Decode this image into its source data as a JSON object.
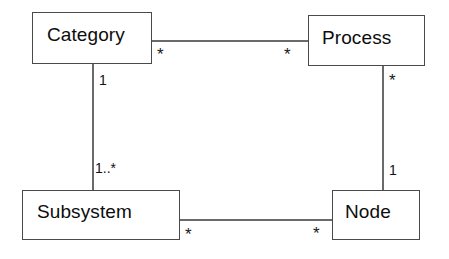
{
  "diagram": {
    "type": "uml-class-diagram",
    "title": "",
    "background_color": "#ffffff",
    "line_color": "#6a6a6a",
    "border_color": "#4a4a4a",
    "text_color": "#0d0d0d",
    "classes": [
      {
        "id": "category",
        "name": "Category"
      },
      {
        "id": "process",
        "name": "Process"
      },
      {
        "id": "subsystem",
        "name": "Subsystem"
      },
      {
        "id": "node",
        "name": "Node"
      }
    ],
    "associations": [
      {
        "id": "category-process",
        "from": "Category",
        "to": "Process",
        "from_multiplicity": "*",
        "to_multiplicity": "*",
        "orientation": "horizontal"
      },
      {
        "id": "category-subsystem",
        "from": "Category",
        "to": "Subsystem",
        "from_multiplicity": "1",
        "to_multiplicity": "1..*",
        "orientation": "vertical"
      },
      {
        "id": "process-node",
        "from": "Process",
        "to": "Node",
        "from_multiplicity": "*",
        "to_multiplicity": "1",
        "orientation": "vertical"
      },
      {
        "id": "subsystem-node",
        "from": "Subsystem",
        "to": "Node",
        "from_multiplicity": "*",
        "to_multiplicity": "*",
        "orientation": "horizontal"
      }
    ],
    "multiplicity_labels": {
      "category_right": "*",
      "process_left": "*",
      "category_bottom": "1",
      "subsystem_top": "1..*",
      "process_bottom": "*",
      "node_top": "1",
      "subsystem_right": "*",
      "node_left": "*"
    }
  }
}
